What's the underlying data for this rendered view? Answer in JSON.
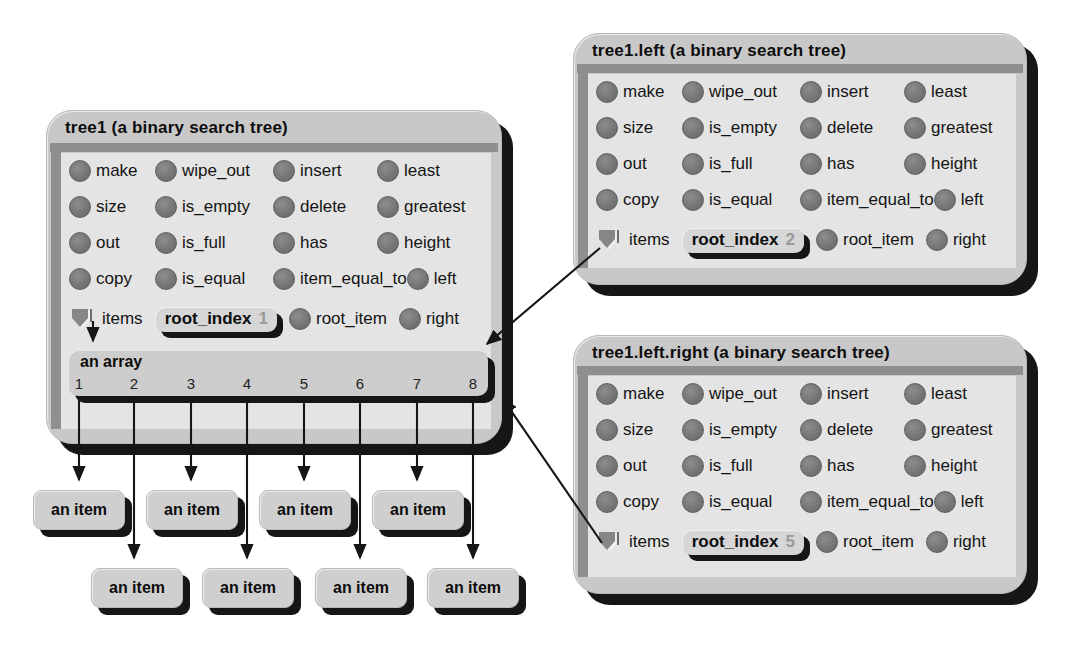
{
  "colors": {
    "box_fill": "#c8c8c8",
    "panel_fill": "#e4e4e4",
    "bar_fill": "#8f8f8f",
    "dot_fill": "#7b7b7b",
    "shadow_black": "#161616",
    "root_index_value_gray": "#9a9a9a"
  },
  "boxes": [
    {
      "title": "tree1 (a binary search tree)",
      "features": [
        [
          "make",
          "wipe_out",
          "insert",
          "least"
        ],
        [
          "size",
          "is_empty",
          "delete",
          "greatest"
        ],
        [
          "out",
          "is_full",
          "has",
          "height"
        ],
        [
          "copy",
          "is_equal",
          "item_equal_to",
          "left"
        ]
      ],
      "items_label": "items",
      "root_index_label": "root_index",
      "root_index_value": "1",
      "root_item_label": "root_item",
      "right_label": "right"
    },
    {
      "title": "tree1.left (a binary search tree)",
      "features": [
        [
          "make",
          "wipe_out",
          "insert",
          "least"
        ],
        [
          "size",
          "is_empty",
          "delete",
          "greatest"
        ],
        [
          "out",
          "is_full",
          "has",
          "height"
        ],
        [
          "copy",
          "is_equal",
          "item_equal_to",
          "left"
        ]
      ],
      "items_label": "items",
      "root_index_label": "root_index",
      "root_index_value": "2",
      "root_item_label": "root_item",
      "right_label": "right"
    },
    {
      "title": "tree1.left.right (a binary search tree)",
      "features": [
        [
          "make",
          "wipe_out",
          "insert",
          "least"
        ],
        [
          "size",
          "is_empty",
          "delete",
          "greatest"
        ],
        [
          "out",
          "is_full",
          "has",
          "height"
        ],
        [
          "copy",
          "is_equal",
          "item_equal_to",
          "left"
        ]
      ],
      "items_label": "items",
      "root_index_label": "root_index",
      "root_index_value": "5",
      "root_item_label": "root_item",
      "right_label": "right"
    }
  ],
  "array_box": {
    "label": "an array",
    "indices": [
      "1",
      "2",
      "3",
      "4",
      "5",
      "6",
      "7",
      "8"
    ]
  },
  "item_boxes": [
    "an item",
    "an item",
    "an item",
    "an item",
    "an item",
    "an item",
    "an item",
    "an item"
  ]
}
